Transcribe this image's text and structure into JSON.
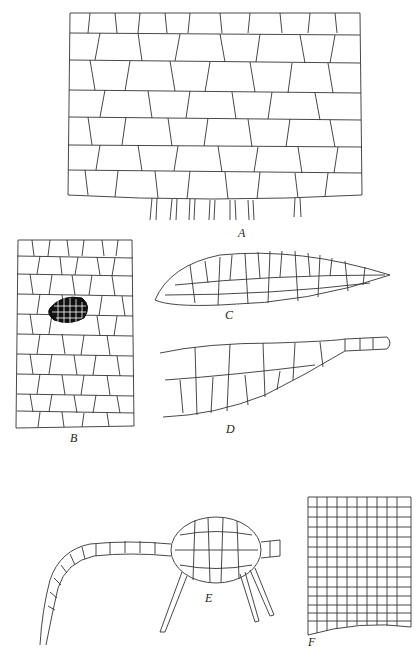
{
  "figure": {
    "type": "botanical cell-tissue illustration plate",
    "panels": [
      {
        "id": "A",
        "label": "A",
        "description": "Large parenchyma tissue sheet with rhizoids descending from the lower margin"
      },
      {
        "id": "B",
        "label": "B",
        "description": "Elongated tissue strip with a dark cluster of small cells near the center"
      },
      {
        "id": "C",
        "label": "C",
        "description": "Lens-shaped lateral segment tapering to a point on the right"
      },
      {
        "id": "D",
        "label": "D",
        "description": "Tapering filament-like lobe ending in a uniseriate row of cells"
      },
      {
        "id": "E",
        "label": "E",
        "description": "Oval multicellular body on a long uniseriate filament, with pointed spine-like hairs"
      },
      {
        "id": "F",
        "label": "F",
        "description": "Tissue field with smaller cells toward the lower margin"
      }
    ]
  },
  "colors": {
    "line": "#333333",
    "background": "#ffffff",
    "dark_cluster": "#111111"
  }
}
